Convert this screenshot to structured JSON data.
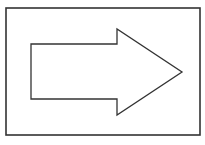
{
  "diagram": {
    "type": "shape-illustration",
    "frame": {
      "x": 6,
      "y": 8,
      "width": 194,
      "height": 127,
      "stroke": "#333333",
      "stroke_width": 1.6,
      "fill": "#ffffff"
    },
    "arrow": {
      "direction": "right",
      "points": "31,44 117,44 117,29 182,72 117,115 117,99 31,99",
      "stroke": "#333333",
      "stroke_width": 1.3,
      "fill": "#ffffff"
    },
    "caption": ""
  }
}
